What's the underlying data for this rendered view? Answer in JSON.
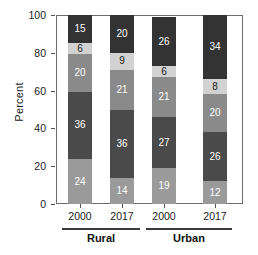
{
  "chart_data": {
    "type": "bar",
    "stacked": true,
    "stack_mode": "percent",
    "title": "",
    "xlabel": "",
    "ylabel": "Percent",
    "ylim": [
      0,
      100
    ],
    "yticks": [
      0,
      20,
      40,
      60,
      80,
      100
    ],
    "grid": false,
    "legend": "none",
    "categories": [
      "2000",
      "2017",
      "2000",
      "2017"
    ],
    "groups": [
      {
        "label": "Rural",
        "categories": [
          "2000",
          "2017"
        ]
      },
      {
        "label": "Urban",
        "categories": [
          "2000",
          "2017"
        ]
      }
    ],
    "series": [
      {
        "name": "segment-1-bottom",
        "color": "#9a9a9a",
        "values": [
          24,
          14,
          19,
          12
        ]
      },
      {
        "name": "segment-2",
        "color": "#4a4a4a",
        "values": [
          36,
          36,
          27,
          26
        ]
      },
      {
        "name": "segment-3",
        "color": "#8a8a8a",
        "values": [
          20,
          21,
          21,
          20
        ]
      },
      {
        "name": "segment-4",
        "color": "#d2d2d2",
        "values": [
          6,
          9,
          6,
          8
        ]
      },
      {
        "name": "segment-5-top",
        "color": "#333333",
        "values": [
          15,
          20,
          26,
          34
        ]
      }
    ],
    "bars": [
      {
        "category": "2000",
        "group": "Rural",
        "segments": [
          24,
          36,
          20,
          6,
          15
        ]
      },
      {
        "category": "2017",
        "group": "Rural",
        "segments": [
          14,
          36,
          21,
          9,
          20
        ]
      },
      {
        "category": "2000",
        "group": "Urban",
        "segments": [
          19,
          27,
          21,
          6,
          26
        ]
      },
      {
        "category": "2017",
        "group": "Urban",
        "segments": [
          12,
          26,
          20,
          8,
          34
        ]
      }
    ]
  }
}
